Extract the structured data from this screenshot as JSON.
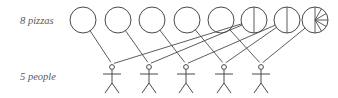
{
  "diagram": {
    "type": "bipartite-matching",
    "background_color": "#ffffff",
    "stroke_color": "#4a4a4a",
    "label_color": "#5a5a5a",
    "labels": {
      "top_row": "8 pizzas",
      "bottom_row": "5 people"
    },
    "top_row": {
      "name": "pizzas",
      "count": 8,
      "radius": 13,
      "center_y": 20,
      "items": [
        {
          "id": "pizza-1",
          "cx": 83,
          "slices": 0,
          "state": "whole"
        },
        {
          "id": "pizza-2",
          "cx": 118,
          "slices": 0,
          "state": "whole"
        },
        {
          "id": "pizza-3",
          "cx": 152,
          "slices": 0,
          "state": "whole"
        },
        {
          "id": "pizza-4",
          "cx": 187,
          "slices": 0,
          "state": "whole"
        },
        {
          "id": "pizza-5",
          "cx": 221,
          "slices": 0,
          "state": "whole"
        },
        {
          "id": "pizza-6",
          "cx": 254,
          "slices": 2,
          "state": "halved"
        },
        {
          "id": "pizza-7",
          "cx": 287,
          "slices": 2,
          "state": "halved"
        },
        {
          "id": "pizza-8",
          "cx": 315,
          "slices": 6,
          "state": "sliced"
        }
      ]
    },
    "bottom_row": {
      "name": "people",
      "count": 5,
      "head_y": 67,
      "items": [
        {
          "id": "person-1",
          "cx": 112
        },
        {
          "id": "person-2",
          "cx": 149
        },
        {
          "id": "person-3",
          "cx": 186
        },
        {
          "id": "person-4",
          "cx": 224
        },
        {
          "id": "person-5",
          "cx": 261
        }
      ]
    },
    "edges": [
      {
        "from": "pizza-1",
        "to": "person-1"
      },
      {
        "from": "pizza-2",
        "to": "person-2"
      },
      {
        "from": "pizza-3",
        "to": "person-3"
      },
      {
        "from": "pizza-4",
        "to": "person-4"
      },
      {
        "from": "pizza-5",
        "to": "person-5"
      },
      {
        "from": "pizza-6",
        "to": "person-1"
      },
      {
        "from": "pizza-6",
        "to": "person-2"
      },
      {
        "from": "pizza-7",
        "to": "person-3"
      },
      {
        "from": "pizza-7",
        "to": "person-4"
      },
      {
        "from": "pizza-8",
        "to": "person-5"
      }
    ]
  }
}
